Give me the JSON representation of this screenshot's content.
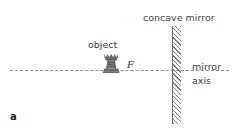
{
  "figure": {
    "panel_label": "a",
    "type": "optics-ray-diagram",
    "background_color": "#ffffff"
  },
  "labels": {
    "concave_mirror": "concave mirror",
    "object": "object",
    "focal_point": "F",
    "mirror_axis_line1": "mirror",
    "mirror_axis_line2": "axis"
  },
  "elements": {
    "mirror": {
      "name": "concave mirror",
      "orientation": "vertical",
      "style": "solid line with hatched backing",
      "line_color": "#6e6e6e",
      "hatch_color": "#7a7a7a"
    },
    "axis": {
      "name": "mirror axis",
      "style": "dashed",
      "color": "#8c8c8c"
    },
    "object": {
      "name": "object",
      "shape": "chess-rook",
      "fill_color": "#6b6b6b"
    },
    "focal_point": {
      "name": "F",
      "marker": "tick on axis"
    }
  }
}
